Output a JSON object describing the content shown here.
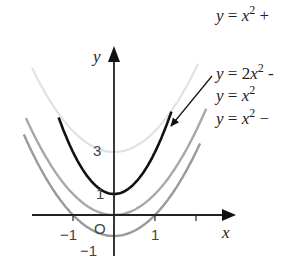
{
  "chart_data": {
    "type": "line",
    "title": "",
    "xlabel": "x",
    "ylabel": "y",
    "xlim": [
      -2.2,
      2.9
    ],
    "ylim": [
      -1.6,
      8
    ],
    "grid": false,
    "x_ticks": [
      -1,
      1,
      2
    ],
    "x_tick_labels": [
      "−1",
      "1",
      ""
    ],
    "y_tick_labels": [
      {
        "value": 3,
        "label": "3"
      },
      {
        "value": 1,
        "label": "1"
      },
      {
        "value": -1,
        "label": "−1"
      }
    ],
    "origin_label": "O",
    "series": [
      {
        "name": "y = x² + 3",
        "label_visible": "y = x² +",
        "a": 1,
        "c": 3,
        "color": "#e2e2e2",
        "width": 2.2
      },
      {
        "name": "y = 2x² + 1",
        "label_visible": "y = 2x² -",
        "a": 2,
        "c": 1,
        "color": "#111111",
        "width": 2.6
      },
      {
        "name": "y = x²",
        "label_visible": "y = x²",
        "a": 1,
        "c": 0,
        "color": "#a8a8a8",
        "width": 2.4
      },
      {
        "name": "y = x² − 1",
        "label_visible": "y = x² −",
        "a": 1,
        "c": -1,
        "color": "#9a9a9a",
        "width": 2.4
      }
    ],
    "annotations": [
      {
        "type": "arrow",
        "from_label": "y = 2x² -",
        "to_series": "y = 2x² + 1"
      }
    ],
    "legend_position": "right"
  },
  "labels": {
    "x_axis": "x",
    "y_axis": "y",
    "origin": "O",
    "tick_neg1_x": "−1",
    "tick_pos1_x": "1",
    "tick_3_y": "3",
    "tick_1_y": "1",
    "tick_neg1_y": "−1"
  },
  "legend": [
    {
      "y": "y",
      "eq": "=",
      "x": "x",
      "exp": "2",
      "coef": "",
      "tail": " +"
    },
    {
      "y": "y",
      "eq": "=",
      "x": "x",
      "exp": "2",
      "coef": "2",
      "tail": " -"
    },
    {
      "y": "y",
      "eq": "=",
      "x": "x",
      "exp": "2",
      "coef": "",
      "tail": ""
    },
    {
      "y": "y",
      "eq": "=",
      "x": "x",
      "exp": "2",
      "coef": "",
      "tail": " −"
    }
  ]
}
